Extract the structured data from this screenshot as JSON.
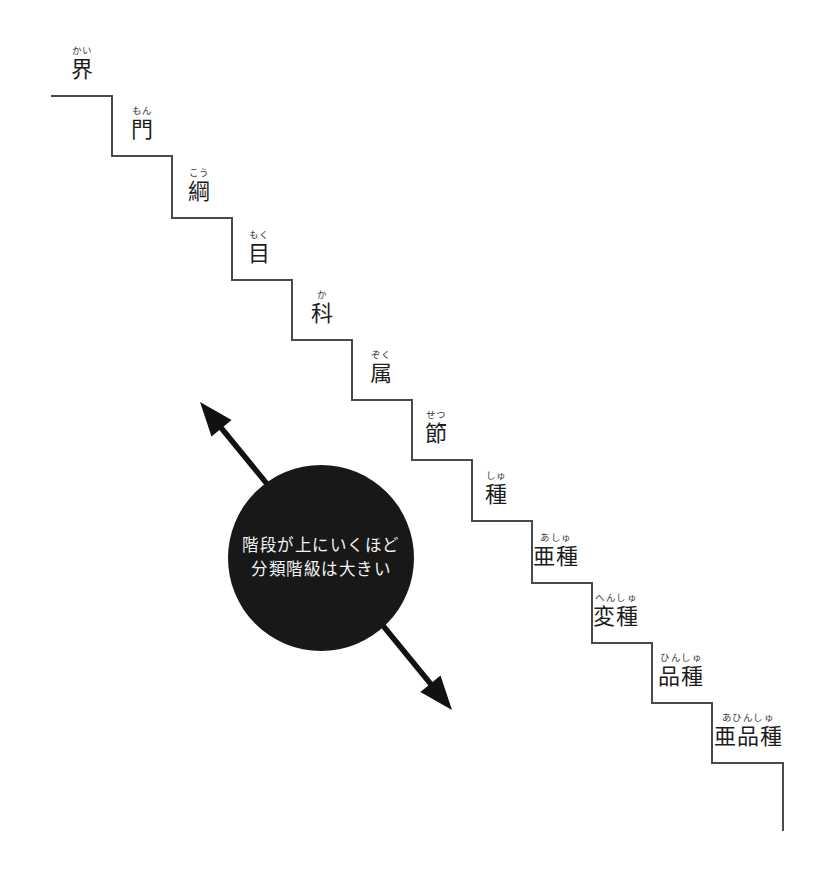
{
  "diagram": {
    "background_color": "#ffffff",
    "line_color": "#4a4a4a",
    "kanji_color": "#1d1d1d",
    "bubble_color": "#181818",
    "bubble_text_color": "#f2f2f2",
    "steps": [
      {
        "kanji": "界",
        "furigana": "かい",
        "tread_y": 96,
        "tread_x1": 52,
        "tread_x2": 112,
        "label_x": 82
      },
      {
        "kanji": "門",
        "furigana": "もん",
        "tread_y": 156,
        "tread_x1": 112,
        "tread_x2": 172,
        "label_x": 142
      },
      {
        "kanji": "綱",
        "furigana": "こう",
        "tread_y": 218,
        "tread_x1": 172,
        "tread_x2": 232,
        "label_x": 199
      },
      {
        "kanji": "目",
        "furigana": "もく",
        "tread_y": 280,
        "tread_x1": 232,
        "tread_x2": 292,
        "label_x": 259
      },
      {
        "kanji": "科",
        "furigana": "か",
        "tread_y": 340,
        "tread_x1": 292,
        "tread_x2": 352,
        "label_x": 322
      },
      {
        "kanji": "属",
        "furigana": "ぞく",
        "tread_y": 400,
        "tread_x1": 352,
        "tread_x2": 412,
        "label_x": 381
      },
      {
        "kanji": "節",
        "furigana": "せつ",
        "tread_y": 460,
        "tread_x1": 412,
        "tread_x2": 472,
        "label_x": 436
      },
      {
        "kanji": "種",
        "furigana": "しゅ",
        "tread_y": 521,
        "tread_x1": 472,
        "tread_x2": 532,
        "label_x": 496
      },
      {
        "kanji": "亜種",
        "furigana": "あしゅ",
        "tread_y": 583,
        "tread_x1": 532,
        "tread_x2": 592,
        "label_x": 556
      },
      {
        "kanji": "変種",
        "furigana": "へんしゅ",
        "tread_y": 643,
        "tread_x1": 592,
        "tread_x2": 652,
        "label_x": 616
      },
      {
        "kanji": "品種",
        "furigana": "ひんしゅ",
        "tread_y": 703,
        "tread_x1": 652,
        "tread_x2": 712,
        "label_x": 681
      },
      {
        "kanji": "亜品種",
        "furigana": "あひんしゅ",
        "tread_y": 763,
        "tread_x1": 712,
        "tread_x2": 783,
        "label_x": 748
      }
    ],
    "final_riser_bottom_y": 830,
    "callout": {
      "lines": [
        "階段が上にいくほど",
        "分類階級は大きい"
      ],
      "center_x": 321,
      "center_y": 558,
      "radius": 93
    },
    "arrow": {
      "label": "双方向矢印",
      "tip_upper": {
        "x": 200,
        "y": 402
      },
      "tip_lower": {
        "x": 452,
        "y": 710
      }
    }
  }
}
